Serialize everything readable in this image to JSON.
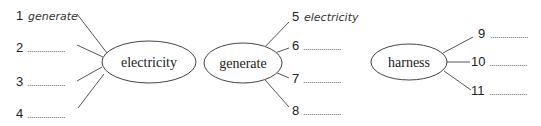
{
  "diagrams": [
    {
      "center": "electricity",
      "items": [
        {
          "number": "1",
          "answer": "generate"
        },
        {
          "number": "2",
          "answer": "..................."
        },
        {
          "number": "3",
          "answer": "..................."
        },
        {
          "number": "4",
          "answer": "..................."
        }
      ]
    },
    {
      "center": "generate",
      "items": [
        {
          "number": "5",
          "answer": "electricity"
        },
        {
          "number": "6",
          "answer": "..................."
        },
        {
          "number": "7",
          "answer": "..................."
        },
        {
          "number": "8",
          "answer": "..................."
        }
      ]
    },
    {
      "center": "harness",
      "items": [
        {
          "number": "9",
          "answer": "..................."
        },
        {
          "number": "10",
          "answer": "..................."
        },
        {
          "number": "11",
          "answer": "..................."
        }
      ]
    }
  ]
}
